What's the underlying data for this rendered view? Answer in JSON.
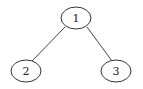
{
  "diagram": {
    "type": "tree",
    "colors": {
      "stroke": "#333333",
      "fill": "#ffffff",
      "text": "#222222",
      "background": "#ffffff"
    },
    "nodes": [
      {
        "id": "1",
        "label": "1",
        "cx": 76,
        "cy": 18,
        "rx": 15,
        "ry": 11
      },
      {
        "id": "2",
        "label": "2",
        "cx": 26,
        "cy": 71,
        "rx": 15,
        "ry": 11
      },
      {
        "id": "3",
        "label": "3",
        "cx": 116,
        "cy": 71,
        "rx": 15,
        "ry": 11
      }
    ],
    "edges": [
      {
        "from": "1",
        "to": "2",
        "x1": 65,
        "y1": 27,
        "x2": 32,
        "y2": 61
      },
      {
        "from": "1",
        "to": "3",
        "x1": 87,
        "y1": 27,
        "x2": 112,
        "y2": 61
      }
    ]
  }
}
